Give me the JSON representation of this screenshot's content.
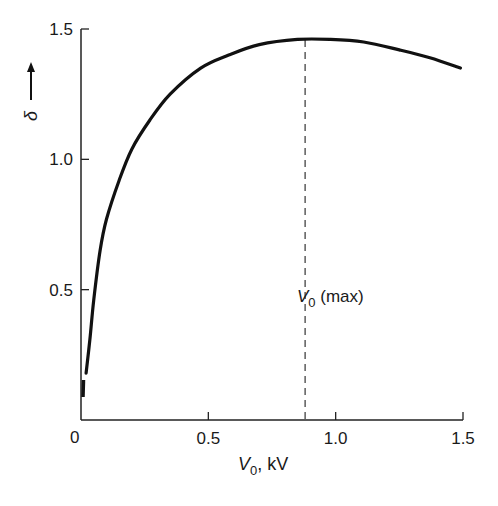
{
  "chart_data": {
    "type": "line",
    "title": "",
    "xlabel": "V0, kV",
    "xlabel_parts": {
      "main": "V",
      "sub": "0",
      "rest": ", kV"
    },
    "ylabel": "δ",
    "ylabel_arrow": "up-arrow",
    "xlim": [
      0,
      1.5
    ],
    "ylim": [
      0,
      1.5
    ],
    "x_ticks": [
      0.5,
      1.0,
      1.5
    ],
    "x_tick_labels": [
      "0.5",
      "1.0",
      "1.5"
    ],
    "y_ticks": [
      0.5,
      1.0,
      1.5
    ],
    "y_tick_labels": [
      "0.5",
      "1.0",
      "1.5"
    ],
    "origin_label": "0",
    "grid": false,
    "legend": null,
    "series": [
      {
        "name": "δ vs V0",
        "x": [
          0.02,
          0.035,
          0.05,
          0.075,
          0.1,
          0.15,
          0.2,
          0.27,
          0.35,
          0.47,
          0.58,
          0.7,
          0.85,
          0.98,
          1.11,
          1.25,
          1.37,
          1.49
        ],
        "values": [
          0.18,
          0.31,
          0.46,
          0.65,
          0.77,
          0.92,
          1.04,
          1.15,
          1.25,
          1.35,
          1.4,
          1.44,
          1.46,
          1.46,
          1.45,
          1.42,
          1.39,
          1.35
        ],
        "color": "#111111"
      }
    ],
    "annotations": [
      {
        "type": "vline",
        "x": 0.88,
        "style": "dashed",
        "label_main": "V",
        "label_sub": "0",
        "label_rest": " (max)",
        "label_y": 0.5
      }
    ]
  },
  "colors": {
    "line": "#111111",
    "axis": "#222222",
    "background": "#ffffff"
  }
}
